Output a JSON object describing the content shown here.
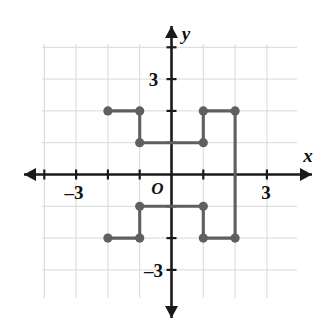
{
  "chart_data": {
    "type": "scatter",
    "title": "",
    "xlabel": "x",
    "ylabel": "y",
    "xlim": [
      -4,
      4
    ],
    "ylim": [
      -4,
      4
    ],
    "grid": true,
    "legend_position": "none",
    "x_tick_labels": [
      {
        "value": -3,
        "label": "–3"
      },
      {
        "value": 3,
        "label": "3"
      }
    ],
    "y_tick_labels": [
      {
        "value": 3,
        "label": "3"
      },
      {
        "value": -3,
        "label": "–3"
      }
    ],
    "origin_label": "O",
    "points": [
      {
        "x": -2,
        "y": 2
      },
      {
        "x": -1,
        "y": 2
      },
      {
        "x": -1,
        "y": 1
      },
      {
        "x": 1,
        "y": 1
      },
      {
        "x": 1,
        "y": 2
      },
      {
        "x": 2,
        "y": 2
      },
      {
        "x": 2,
        "y": -2
      },
      {
        "x": 1,
        "y": -2
      },
      {
        "x": 1,
        "y": -1
      },
      {
        "x": -1,
        "y": -1
      },
      {
        "x": -1,
        "y": -2
      },
      {
        "x": -2,
        "y": -2
      }
    ],
    "polygon_path": [
      {
        "x": -2,
        "y": 2
      },
      {
        "x": -1,
        "y": 2
      },
      {
        "x": -1,
        "y": 1
      },
      {
        "x": 1,
        "y": 1
      },
      {
        "x": 1,
        "y": 2
      },
      {
        "x": 2,
        "y": 2
      },
      {
        "x": 2,
        "y": -2
      },
      {
        "x": 1,
        "y": -2
      },
      {
        "x": 1,
        "y": -1
      },
      {
        "x": -1,
        "y": -1
      },
      {
        "x": -1,
        "y": -2
      },
      {
        "x": -2,
        "y": -2
      }
    ],
    "point_color": "#5f5f5f",
    "line_color": "#5f5f5f",
    "axis_color": "#1a1a1a",
    "grid_color": "#d8d8d8"
  },
  "geometry": {
    "origin_px": {
      "x": 171.5,
      "y": 174.5
    },
    "unit_px": 31.8,
    "grid_bounds_px": {
      "left": 42,
      "top": 44,
      "right": 297,
      "bottom": 298
    },
    "point_radius_px": 4.6,
    "stroke_width_px": 3.1
  }
}
